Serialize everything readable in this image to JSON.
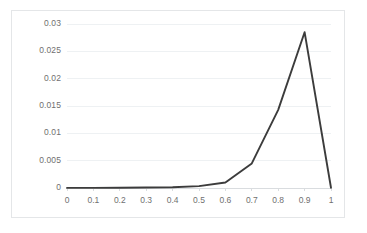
{
  "chart_data": {
    "type": "line",
    "title": "",
    "xlabel": "",
    "ylabel": "",
    "x": [
      0,
      0.1,
      0.2,
      0.3,
      0.4,
      0.5,
      0.6,
      0.7,
      0.8,
      0.9,
      1
    ],
    "values": [
      2e-05,
      3e-05,
      5e-05,
      8e-05,
      0.00015,
      0.00035,
      0.001,
      0.0045,
      0.0143,
      0.0285,
      5e-05
    ],
    "series": [
      {
        "name": "series1",
        "values": [
          2e-05,
          3e-05,
          5e-05,
          8e-05,
          0.00015,
          0.00035,
          0.001,
          0.0045,
          0.0143,
          0.0285,
          5e-05
        ]
      }
    ],
    "xtick_labels": [
      "0",
      "0.1",
      "0.2",
      "0.3",
      "0.4",
      "0.5",
      "0.6",
      "0.7",
      "0.8",
      "0.9",
      "1"
    ],
    "ytick_labels": [
      "0",
      "0.005",
      "0.01",
      "0.015",
      "0.02",
      "0.025",
      "0.03"
    ],
    "ytick_values": [
      0,
      0.005,
      0.01,
      0.015,
      0.02,
      0.025,
      0.03
    ],
    "xlim": [
      0,
      1
    ],
    "ylim": [
      0,
      0.03
    ],
    "grid": "horizontal",
    "legend": "none",
    "line_color": "#3c3c3c",
    "grid_color": "#eef1f3",
    "axis_color": "#d9dcdf",
    "tick_label_color": "#707070",
    "plot_background": "#ffffff",
    "border_color": "#e4e6e8"
  }
}
